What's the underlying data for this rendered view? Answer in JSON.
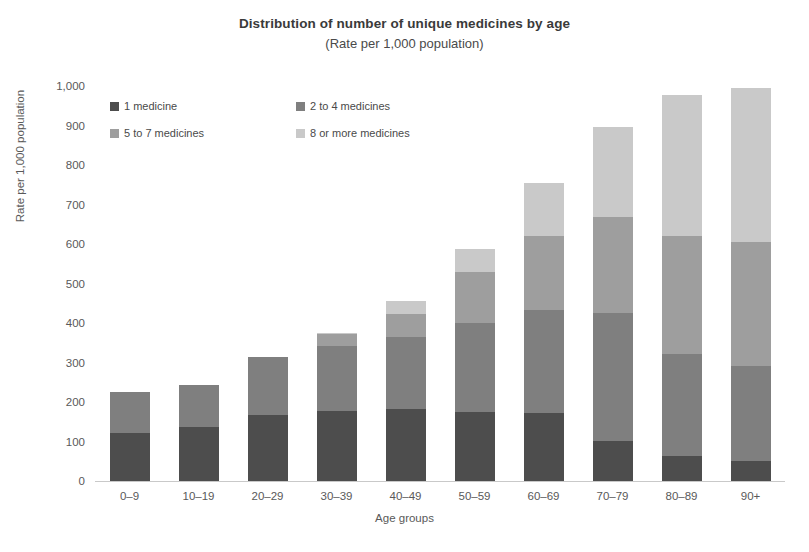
{
  "chart_data": {
    "type": "bar",
    "subtype": "stacked-vertical",
    "title": "Distribution of number of unique medicines by age",
    "subtitle": "(Rate per 1,000 population)",
    "xlabel": "Age groups",
    "ylabel": "Rate per 1,000 population",
    "ylim": [
      0,
      1000
    ],
    "ytick_labels": [
      "1,000",
      "900",
      "800",
      "700",
      "600",
      "500",
      "400",
      "300",
      "200",
      "100",
      "0"
    ],
    "ytick_values": [
      1000,
      900,
      800,
      700,
      600,
      500,
      400,
      300,
      200,
      100,
      0
    ],
    "grid": false,
    "legend_position": "upper-left-inside",
    "categories": [
      "0–9",
      "10–19",
      "20–29",
      "30–39",
      "40–49",
      "50–59",
      "60–69",
      "70–79",
      "80–89",
      "90+"
    ],
    "series": [
      {
        "name": "1 medicine",
        "color": "#4d4d4d",
        "values": [
          122,
          138,
          168,
          178,
          182,
          175,
          172,
          101,
          63,
          51
        ]
      },
      {
        "name": "2 to 4 medicines",
        "color": "#7f7f7f",
        "values": [
          103,
          105,
          145,
          163,
          182,
          225,
          261,
          325,
          258,
          239
        ]
      },
      {
        "name": "5 to 7 medicines",
        "color": "#9e9e9e",
        "values": [
          0,
          0,
          0,
          30,
          60,
          129,
          187,
          243,
          299,
          315
        ]
      },
      {
        "name": "8 or more medicines",
        "color": "#c9c9c9",
        "values": [
          0,
          0,
          0,
          4,
          33,
          58,
          135,
          228,
          358,
          390
        ]
      }
    ],
    "totals": [
      225,
      243,
      313,
      375,
      457,
      587,
      755,
      897,
      978,
      995
    ]
  },
  "axis": {
    "y_title": "Rate per 1,000 population",
    "x_title": "Age groups"
  },
  "colors": {
    "series_1": "#4d4d4d",
    "series_2": "#7f7f7f",
    "series_3": "#9e9e9e",
    "series_4": "#c9c9c9",
    "axis_line": "#c9c9c9",
    "text": "#595959",
    "title_text": "#3a3a3a",
    "background": "#ffffff"
  }
}
